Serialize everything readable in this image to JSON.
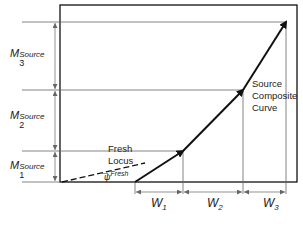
{
  "diagram": {
    "labels": {
      "m3": {
        "base": "M",
        "sub": "3",
        "sup": "Source"
      },
      "m2": {
        "base": "M",
        "sub": "2",
        "sup": "Source"
      },
      "m1": {
        "base": "M",
        "sub": "1",
        "sup": "Source"
      },
      "w1": {
        "base": "W",
        "sub": "1"
      },
      "w2": {
        "base": "W",
        "sub": "2"
      },
      "w3": {
        "base": "W",
        "sub": "3"
      },
      "fresh_locus_line1": "Fresh",
      "fresh_locus_line2": "Locus",
      "psi_symbol": "ψ",
      "psi_sup": "Fresh",
      "composite_line1": "Source",
      "composite_line2": "Composite",
      "composite_line3": "Curve"
    },
    "geometry": {
      "frame": {
        "x1": 60,
        "y1": 5,
        "x2": 297,
        "y2": 182
      },
      "levels_y": [
        22,
        90,
        151,
        182
      ],
      "curve_points": [
        [
          135,
          182
        ],
        [
          183,
          151
        ],
        [
          243,
          90
        ],
        [
          286,
          22
        ]
      ],
      "fresh_locus": {
        "from": [
          62,
          182
        ],
        "to": [
          145,
          163
        ]
      },
      "w_ticks_x": [
        135,
        183,
        243,
        286
      ]
    },
    "colors": {
      "line": "#111111",
      "guide": "#555555",
      "text": "#222222"
    }
  }
}
